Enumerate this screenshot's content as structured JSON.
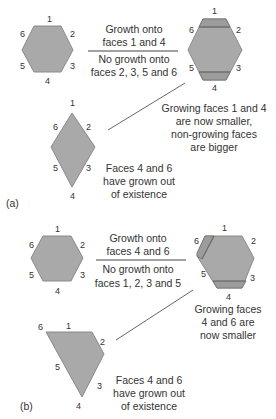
{
  "figure": {
    "part_a": {
      "label": "(a)",
      "initial_crystal": {
        "faces": [
          "1",
          "2",
          "3",
          "4",
          "5",
          "6"
        ]
      },
      "growth_condition": {
        "numerator": [
          "Growth onto",
          "faces 1 and 4"
        ],
        "denominator": [
          "No growth onto",
          "faces 2, 3, 5 and 6"
        ]
      },
      "intermediate_crystal": {
        "faces": [
          "1",
          "2",
          "3",
          "4",
          "5",
          "6"
        ],
        "caption": [
          "Growing faces 1 and 4",
          "are now smaller,",
          "non-growing faces",
          "are bigger"
        ]
      },
      "final_crystal": {
        "faces": [
          "1",
          "2",
          "3",
          "4",
          "5",
          "6"
        ],
        "caption": [
          "Faces 4 and 6",
          "have grown out",
          "of existence"
        ]
      }
    },
    "part_b": {
      "label": "(b)",
      "initial_crystal": {
        "faces": [
          "1",
          "2",
          "3",
          "4",
          "5",
          "6"
        ]
      },
      "growth_condition": {
        "numerator": [
          "Growth onto",
          "faces 4 and 6"
        ],
        "denominator": [
          "No growth onto",
          "faces 1, 2, 3 and 5"
        ]
      },
      "intermediate_crystal": {
        "faces": [
          "1",
          "2",
          "3",
          "4",
          "5",
          "6"
        ],
        "caption": [
          "Growing faces",
          "4 and 6 are",
          "now smaller"
        ]
      },
      "final_crystal": {
        "faces": [
          "1",
          "2",
          "3",
          "4",
          "5",
          "6"
        ],
        "caption": [
          "Faces 4 and 6",
          "have grown out",
          "of existence"
        ]
      }
    }
  }
}
